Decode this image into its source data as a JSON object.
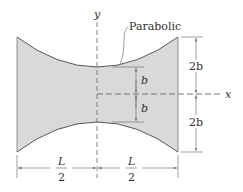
{
  "diagram": {
    "curve_label": "Parabolic",
    "axes": {
      "x_label": "x",
      "y_label": "y"
    },
    "dimensions": {
      "inner_top": "b",
      "inner_bottom": "b",
      "outer_top": "2b",
      "outer_bottom": "2b",
      "left_half": {
        "num": "L",
        "den": "2"
      },
      "right_half": {
        "num": "L",
        "den": "2"
      }
    },
    "colors": {
      "fill": "#d9d9d9",
      "stroke": "#555555",
      "dim": "#777777"
    }
  }
}
